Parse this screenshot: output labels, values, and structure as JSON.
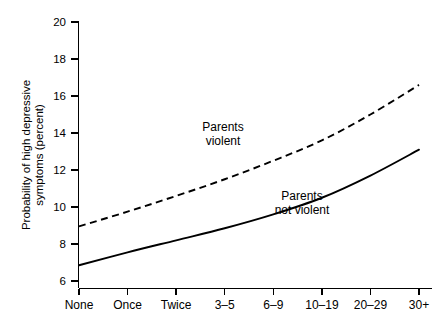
{
  "chart_data": {
    "type": "line",
    "title": "",
    "subtitle": "",
    "xlabel": "",
    "ylabel": "Probability of high depressive symptoms (percent)",
    "ylabel_line1": "Probability of high depressive",
    "ylabel_line2": "symptoms (percent)",
    "categories": [
      "None",
      "Once",
      "Twice",
      "3–5",
      "6–9",
      "10–19",
      "20–29",
      "30+"
    ],
    "ylim": [
      6,
      20
    ],
    "yticks": [
      6,
      8,
      10,
      12,
      14,
      16,
      18,
      20
    ],
    "ytick_labels": [
      "6",
      "8",
      "10",
      "12",
      "14",
      "16",
      "18",
      "20"
    ],
    "grid": false,
    "legend_position": "inline-annotation",
    "series": [
      {
        "name": "Parents violent",
        "style": "dashed",
        "color": "#000000",
        "values": [
          8.95,
          9.75,
          10.6,
          11.5,
          12.5,
          13.6,
          15.0,
          16.6
        ]
      },
      {
        "name": "Parents not violent",
        "style": "solid",
        "color": "#000000",
        "values": [
          6.85,
          7.55,
          8.2,
          8.85,
          9.6,
          10.5,
          11.7,
          13.1
        ]
      }
    ],
    "annotations": [
      {
        "id": "annotation-parents-violent",
        "line1": "Parents",
        "line2": "violent",
        "x_px": 223,
        "y_px": 131
      },
      {
        "id": "annotation-parents-not-violent",
        "line1": "Parents",
        "line2": "not violent",
        "x_px": 302,
        "y_px": 200
      }
    ]
  }
}
